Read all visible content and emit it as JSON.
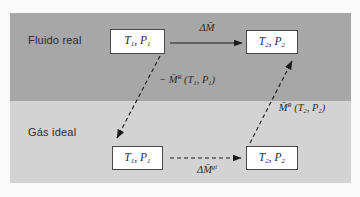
{
  "figure": {
    "regions": [
      {
        "name": "real-fluid",
        "label": "Fluido real"
      },
      {
        "name": "ideal-gas",
        "label": "Gás ideal"
      }
    ],
    "states": {
      "real_1": [
        {
          "t": "T"
        },
        {
          "t": "1",
          "v": "sub"
        },
        {
          "t": ", P"
        },
        {
          "t": "1",
          "v": "sub"
        }
      ],
      "real_2": [
        {
          "t": "T"
        },
        {
          "t": "2",
          "v": "sub"
        },
        {
          "t": ", P"
        },
        {
          "t": "2",
          "v": "sub"
        }
      ],
      "ideal_1": [
        {
          "t": "T"
        },
        {
          "t": "1",
          "v": "sub"
        },
        {
          "t": ", P"
        },
        {
          "t": "1",
          "v": "sub"
        }
      ],
      "ideal_2": [
        {
          "t": "T"
        },
        {
          "t": "2",
          "v": "sub"
        },
        {
          "t": ", P"
        },
        {
          "t": "2",
          "v": "sub"
        }
      ]
    },
    "arrows": {
      "real_path": {
        "style": "solid",
        "label": [
          {
            "t": "ΔM̄"
          }
        ]
      },
      "departure_1": {
        "style": "dashed",
        "label": [
          {
            "t": "− M̄"
          },
          {
            "t": "R",
            "v": "sup"
          },
          {
            "t": " (T"
          },
          {
            "t": "1",
            "v": "sub"
          },
          {
            "t": ", P"
          },
          {
            "t": "1",
            "v": "sub"
          },
          {
            "t": ")"
          }
        ]
      },
      "departure_2": {
        "style": "dashed",
        "label": [
          {
            "t": "M̄"
          },
          {
            "t": "R",
            "v": "sup"
          },
          {
            "t": " (T"
          },
          {
            "t": "2",
            "v": "sub"
          },
          {
            "t": ", P"
          },
          {
            "t": "2",
            "v": "sub"
          },
          {
            "t": ")"
          }
        ]
      },
      "ideal_path": {
        "style": "dashed",
        "label": [
          {
            "t": "ΔM̄"
          },
          {
            "t": "gi",
            "v": "sup"
          }
        ]
      }
    },
    "colors": {
      "background": "#fafafa",
      "real_band": "#a7a7a7",
      "ideal_band": "#d3d3d3",
      "box_fill": "#ffffff",
      "box_border": "#4a4a4a",
      "arrow": "#1a1a1a",
      "text": "#2b2b2b"
    }
  }
}
